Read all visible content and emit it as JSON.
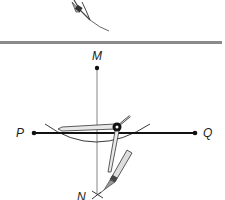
{
  "diagram": {
    "type": "geometric-construction",
    "divider_color": "#8a8a8a",
    "line_color": "#1a1a1a",
    "points": {
      "M": {
        "label": "M",
        "x": 97,
        "y": 68
      },
      "P": {
        "label": "P",
        "x": 34,
        "y": 133
      },
      "Q": {
        "label": "Q",
        "x": 195,
        "y": 133
      },
      "N": {
        "label": "N",
        "x": 97,
        "y": 196
      }
    },
    "segments": [
      {
        "from": "P",
        "to": "Q",
        "name": "line-PQ"
      },
      {
        "from": "M",
        "to": "N",
        "name": "perpendicular-MN"
      }
    ],
    "tools": [
      "compass-top-partial",
      "compass-main"
    ]
  }
}
